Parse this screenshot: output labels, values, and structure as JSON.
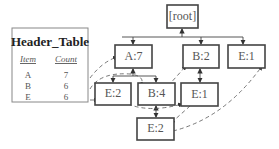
{
  "header_table": {
    "title": "Header_Table",
    "columns": [
      "Item",
      "Count"
    ],
    "rows": [
      {
        "item": "A",
        "count": "7"
      },
      {
        "item": "B",
        "count": "6"
      },
      {
        "item": "E",
        "count": "6"
      }
    ]
  },
  "tree": {
    "nodes": [
      {
        "id": "root",
        "label": "[root]"
      },
      {
        "id": "a7",
        "label": "A:7"
      },
      {
        "id": "b2",
        "label": "B:2"
      },
      {
        "id": "e1_top",
        "label": "E:1"
      },
      {
        "id": "e2_left",
        "label": "E:2"
      },
      {
        "id": "b4",
        "label": "B:4"
      },
      {
        "id": "e1_mid",
        "label": "E:1"
      },
      {
        "id": "e2_bottom",
        "label": "E:2"
      }
    ],
    "edges": [
      [
        "a7",
        "root"
      ],
      [
        "b2",
        "root"
      ],
      [
        "e1_top",
        "root"
      ],
      [
        "e2_left",
        "a7"
      ],
      [
        "b4",
        "a7"
      ],
      [
        "e1_mid",
        "b2"
      ],
      [
        "e2_bottom",
        "b4"
      ]
    ],
    "node_links": [
      [
        "header-A",
        "a7"
      ],
      [
        "header-B",
        "b4"
      ],
      [
        "header-E",
        "e2_left"
      ],
      [
        "b4",
        "b2"
      ],
      [
        "e2_left",
        "e1_mid"
      ],
      [
        "e1_mid",
        "e2_bottom"
      ],
      [
        "e2_bottom",
        "e1_top"
      ]
    ]
  }
}
